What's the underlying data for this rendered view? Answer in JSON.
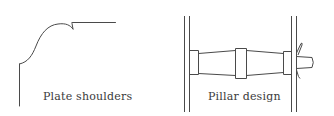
{
  "figures": [
    {
      "caption": "Plate shoulders",
      "drawing": "plate-shoulder-profile"
    },
    {
      "caption": "Pillar design",
      "drawing": "pillar-between-plates"
    }
  ],
  "colors": {
    "line": "#4a4a4a",
    "background": "#ffffff",
    "text": "#3a3a3a"
  }
}
